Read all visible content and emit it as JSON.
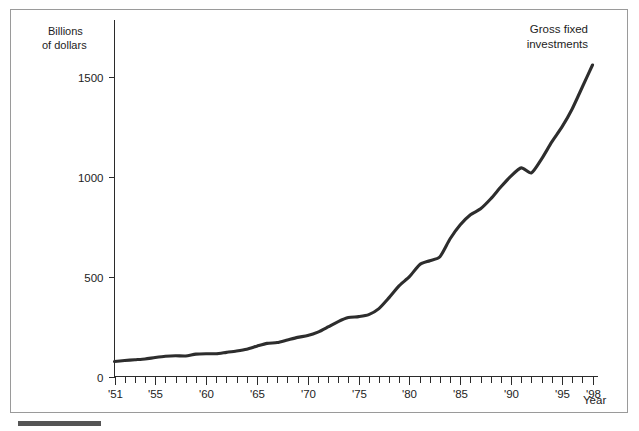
{
  "chart_data": {
    "type": "line",
    "title": "",
    "xlabel": "Year",
    "ylabel": "Billions of dollars",
    "ylabel_line1": "Billions",
    "ylabel_line2": "of dollars",
    "grid": false,
    "legend": "none",
    "annotation": "Gross fixed investments",
    "annotation_line1": "Gross fixed",
    "annotation_line2": "investments",
    "series_name": "Gross fixed investments",
    "line_color": "#2d2d2d",
    "axis_color": "#2b2b2b",
    "xlim": [
      1951,
      1998
    ],
    "ylim": [
      0,
      1800
    ],
    "y_ticks": [
      0,
      500,
      1000,
      1500
    ],
    "y_tick_labels": [
      "0",
      "500",
      "1000",
      "1500"
    ],
    "x_tick_years": [
      1951,
      1952,
      1953,
      1954,
      1955,
      1956,
      1957,
      1958,
      1959,
      1960,
      1961,
      1962,
      1963,
      1964,
      1965,
      1966,
      1967,
      1968,
      1969,
      1970,
      1971,
      1972,
      1973,
      1974,
      1975,
      1976,
      1977,
      1978,
      1979,
      1980,
      1981,
      1982,
      1983,
      1984,
      1985,
      1986,
      1987,
      1988,
      1989,
      1990,
      1991,
      1992,
      1993,
      1994,
      1995,
      1996,
      1997,
      1998
    ],
    "x_labeled_years": [
      1951,
      1955,
      1960,
      1965,
      1970,
      1975,
      1980,
      1985,
      1990,
      1995,
      1998
    ],
    "x_tick_labels": [
      "'51",
      "'55",
      "'60",
      "'65",
      "'70",
      "'75",
      "'80",
      "'85",
      "'90",
      "'95",
      "'98"
    ],
    "x": [
      1951,
      1952,
      1953,
      1954,
      1955,
      1956,
      1957,
      1958,
      1959,
      1960,
      1961,
      1962,
      1963,
      1964,
      1965,
      1966,
      1967,
      1968,
      1969,
      1970,
      1971,
      1972,
      1973,
      1974,
      1975,
      1976,
      1977,
      1978,
      1979,
      1980,
      1981,
      1982,
      1983,
      1984,
      1985,
      1986,
      1987,
      1988,
      1989,
      1990,
      1991,
      1992,
      1993,
      1994,
      1995,
      1996,
      1997,
      1998
    ],
    "values": [
      75,
      80,
      84,
      88,
      95,
      101,
      104,
      103,
      112,
      114,
      114,
      121,
      128,
      137,
      152,
      166,
      170,
      183,
      196,
      205,
      222,
      248,
      275,
      295,
      300,
      310,
      340,
      395,
      455,
      500,
      560,
      580,
      600,
      690,
      760,
      810,
      840,
      890,
      950,
      1005,
      1045,
      1020,
      1090,
      1175,
      1250,
      1340,
      1450,
      1560
    ]
  },
  "axes": {
    "y_axis_name": "y-axis",
    "x_axis_name": "x-axis"
  }
}
